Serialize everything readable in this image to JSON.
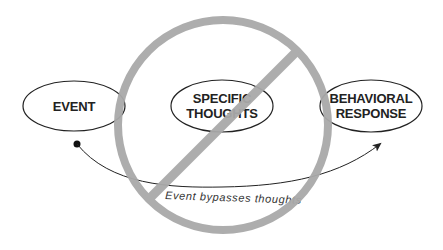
{
  "diagram": {
    "nodes": [
      {
        "id": "event",
        "lines": [
          "EVENT"
        ]
      },
      {
        "id": "specific-thoughts",
        "lines": [
          "SPECIFIC",
          "THOUGHTS"
        ]
      },
      {
        "id": "behavioral-response",
        "lines": [
          "BEHAVIORAL",
          "RESPONSE"
        ]
      }
    ],
    "edge": {
      "from": "event",
      "to": "behavioral-response",
      "label": "Event bypasses thoughts"
    },
    "overlay": {
      "symbol": "prohibition-sign",
      "color": "#a9a9a9",
      "covers": "specific-thoughts"
    },
    "colors": {
      "stroke": "#222222",
      "overlay": "#a9a9a9",
      "background": "#ffffff"
    }
  }
}
